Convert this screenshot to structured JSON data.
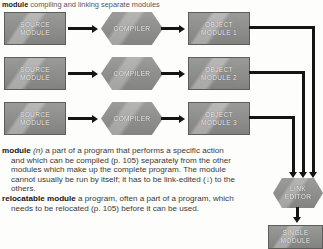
{
  "caption": {
    "headword": "module",
    "rest": " compiling and linking separate modules"
  },
  "diagram": {
    "rows": [
      {
        "source": "SOURCE\nMODULE",
        "process": "COMPILER",
        "output": "OBJECT\nMODULE 1"
      },
      {
        "source": "SOURCE\nMODULE",
        "process": "COMPILER",
        "output": "OBJECT\nMODULE 2"
      },
      {
        "source": "SOURCE\nMODULE",
        "process": "COMPILER",
        "output": "OBJECT\nMODULE 3"
      }
    ],
    "link_editor": "LINK\nEDITOR",
    "single_module": "SINGLE\nMODULE"
  },
  "glossary": {
    "entries": [
      {
        "headword": "module",
        "pos": "(n)",
        "body": " a part of a program that performs a specific action and which can be compiled (p. 105) separately from the other modules which make up the complete program. The module cannot usually be run by itself; it has to be link-edited (↓) to the others."
      },
      {
        "headword": "relocatable module",
        "pos": "",
        "body": " a program, often a part of a program, which needs to be relocated (p. 105) before it can be used."
      }
    ]
  },
  "colors": {
    "node_fill": "#8d8d8c",
    "node_stroke": "#5d5d5c",
    "connector": "#141414",
    "page_bg": "#fdfdfb",
    "text": "#3a3a3a"
  }
}
